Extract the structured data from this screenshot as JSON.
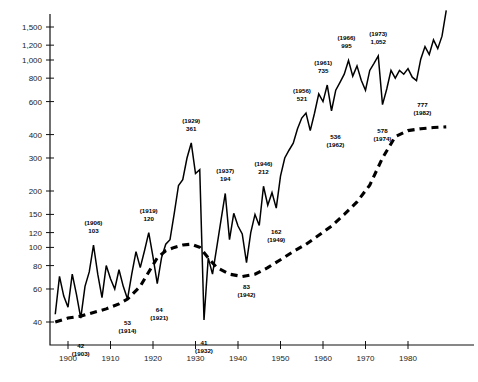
{
  "chart_data": {
    "type": "line",
    "title": "",
    "xlabel": "",
    "ylabel": "",
    "yscale": "log",
    "ylim": [
      36,
      1700
    ],
    "xlim": [
      1896,
      1991
    ],
    "grid": false,
    "legend": null,
    "y_ticks": [
      40,
      60,
      80,
      100,
      120,
      150,
      200,
      300,
      400,
      600,
      800,
      1000,
      1200,
      1500
    ],
    "y_tick_labels": [
      "40",
      "60",
      "80",
      "100",
      "120",
      "150",
      "200",
      "300",
      "400",
      "600",
      "800",
      "1,000",
      "1,200",
      "1,500"
    ],
    "x_ticks": [
      1900,
      1910,
      1920,
      1930,
      1940,
      1950,
      1960,
      1970,
      1980
    ],
    "x_tick_labels": [
      "1900",
      "1910",
      "1920",
      "1930",
      "1940",
      "1950",
      "1960",
      "1970",
      "1980"
    ],
    "series": [
      {
        "name": "annual-series",
        "style": "solid",
        "x": [
          1897,
          1898,
          1899,
          1900,
          1901,
          1902,
          1903,
          1904,
          1905,
          1906,
          1907,
          1908,
          1909,
          1910,
          1911,
          1912,
          1913,
          1914,
          1915,
          1916,
          1917,
          1918,
          1919,
          1920,
          1921,
          1922,
          1923,
          1924,
          1925,
          1926,
          1927,
          1928,
          1929,
          1930,
          1931,
          1932,
          1933,
          1934,
          1935,
          1936,
          1937,
          1938,
          1939,
          1940,
          1941,
          1942,
          1943,
          1944,
          1945,
          1946,
          1947,
          1948,
          1949,
          1950,
          1951,
          1952,
          1953,
          1954,
          1955,
          1956,
          1957,
          1958,
          1959,
          1960,
          1961,
          1962,
          1963,
          1964,
          1965,
          1966,
          1967,
          1968,
          1969,
          1970,
          1971,
          1972,
          1973,
          1974,
          1975,
          1976,
          1977,
          1978,
          1979,
          1980,
          1981,
          1982,
          1983,
          1984,
          1985,
          1986,
          1987,
          1988,
          1989
        ],
        "y": [
          44,
          70,
          55,
          48,
          72,
          56,
          42,
          62,
          74,
          103,
          72,
          54,
          80,
          68,
          60,
          76,
          62,
          53,
          72,
          95,
          78,
          96,
          120,
          89,
          64,
          88,
          104,
          110,
          152,
          214,
          230,
          300,
          361,
          248,
          260,
          41,
          88,
          72,
          100,
          140,
          194,
          110,
          152,
          130,
          118,
          83,
          120,
          150,
          131,
          212,
          168,
          196,
          162,
          240,
          300,
          330,
          360,
          430,
          490,
          521,
          420,
          520,
          660,
          600,
          735,
          536,
          690,
          760,
          840,
          995,
          820,
          930,
          780,
          690,
          880,
          960,
          1052,
          578,
          700,
          880,
          800,
          880,
          840,
          900,
          810,
          777,
          1010,
          1180,
          1070,
          1280,
          1150,
          1340,
          1840
        ]
      },
      {
        "name": "trend-series",
        "style": "dashed",
        "x": [
          1897,
          1900,
          1903,
          1906,
          1909,
          1912,
          1914,
          1917,
          1919,
          1921,
          1923,
          1925,
          1927,
          1929,
          1931,
          1933,
          1935,
          1938,
          1941,
          1944,
          1947,
          1950,
          1953,
          1956,
          1959,
          1962,
          1965,
          1968,
          1971,
          1974,
          1977,
          1980,
          1983,
          1986,
          1989
        ],
        "y": [
          40,
          42,
          43,
          45,
          47,
          50,
          53,
          62,
          74,
          88,
          96,
          100,
          103,
          104,
          100,
          88,
          78,
          72,
          70,
          72,
          78,
          86,
          95,
          104,
          116,
          130,
          150,
          175,
          215,
          300,
          390,
          420,
          430,
          436,
          440
        ]
      }
    ],
    "annotations": [
      {
        "text_line1": "42",
        "text_line2": "(1903)",
        "x": 1903,
        "y": 42,
        "order": "value-first",
        "dx": 0,
        "dy": 30
      },
      {
        "text_line1": "(1906)",
        "text_line2": "103",
        "x": 1906,
        "y": 103,
        "order": "year-first",
        "dx": 0,
        "dy": -20
      },
      {
        "text_line1": "53",
        "text_line2": "(1914)",
        "x": 1914,
        "y": 53,
        "order": "value-first",
        "dx": 0,
        "dy": 26
      },
      {
        "text_line1": "(1919)",
        "text_line2": "120",
        "x": 1919,
        "y": 120,
        "order": "year-first",
        "dx": 0,
        "dy": -20
      },
      {
        "text_line1": "64",
        "text_line2": "(1921)",
        "x": 1921,
        "y": 64,
        "order": "value-first",
        "dx": 2,
        "dy": 28
      },
      {
        "text_line1": "(1929)",
        "text_line2": "361",
        "x": 1929,
        "y": 361,
        "order": "year-first",
        "dx": 0,
        "dy": -20
      },
      {
        "text_line1": "41",
        "text_line2": "(1932)",
        "x": 1932,
        "y": 41,
        "order": "value-first",
        "dx": 0,
        "dy": 25
      },
      {
        "text_line1": "(1937)",
        "text_line2": "194",
        "x": 1937,
        "y": 194,
        "order": "year-first",
        "dx": 0,
        "dy": -20
      },
      {
        "text_line1": "83",
        "text_line2": "(1942)",
        "x": 1942,
        "y": 83,
        "order": "value-first",
        "dx": 0,
        "dy": 26
      },
      {
        "text_line1": "(1946)",
        "text_line2": "212",
        "x": 1946,
        "y": 212,
        "order": "year-first",
        "dx": 0,
        "dy": -20
      },
      {
        "text_line1": "162",
        "text_line2": "(1949)",
        "x": 1949,
        "y": 162,
        "order": "value-first",
        "dx": 0,
        "dy": 26
      },
      {
        "text_line1": "(1956)",
        "text_line2": "521",
        "x": 1956,
        "y": 521,
        "order": "year-first",
        "dx": -4,
        "dy": -20
      },
      {
        "text_line1": "(1961)",
        "text_line2": "735",
        "x": 1961,
        "y": 735,
        "order": "year-first",
        "dx": -4,
        "dy": -20
      },
      {
        "text_line1": "536",
        "text_line2": "(1962)",
        "x": 1962,
        "y": 536,
        "order": "value-first",
        "dx": 4,
        "dy": 28
      },
      {
        "text_line1": "(1966)",
        "text_line2": "995",
        "x": 1966,
        "y": 995,
        "order": "year-first",
        "dx": -2,
        "dy": -20
      },
      {
        "text_line1": "(1973)",
        "text_line2": "1,052",
        "x": 1973,
        "y": 1052,
        "order": "year-first",
        "dx": 0,
        "dy": -20
      },
      {
        "text_line1": "578",
        "text_line2": "(1974)",
        "x": 1974,
        "y": 578,
        "order": "value-first",
        "dx": 0,
        "dy": 28
      },
      {
        "text_line1": "777",
        "text_line2": "(1982)",
        "x": 1982,
        "y": 777,
        "order": "value-first",
        "dx": 6,
        "dy": 26
      },
      {
        "text_line1": "(1989)",
        "text_line2": "1,840",
        "x": 1989,
        "y": 1840,
        "order": "year-first",
        "dx": -8,
        "dy": -20
      }
    ]
  }
}
